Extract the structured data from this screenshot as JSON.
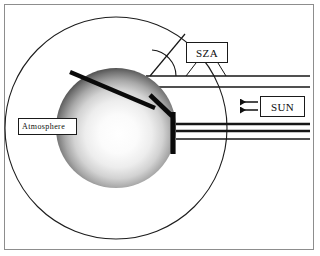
{
  "figure": {
    "background_color": "#ffffff",
    "frame_color": "#8d8d8d",
    "ink_color": "#0d0d0d"
  },
  "labels": {
    "sza": "SZA",
    "sun": "SUN",
    "atmosphere": "Atmosphere"
  },
  "elements": {
    "outer_circle_name": "atmosphere-boundary-circle",
    "planet_name": "planet-sphere",
    "zenith_name": "zenith-direction-bar",
    "surface_name": "surface-tangent-bar",
    "terminator_name": "terminator-bar",
    "angle_arc_name": "sza-angle-arc",
    "ray_group_name": "solar-ray-lines",
    "arrow_group_name": "sun-direction-arrows"
  },
  "geometry": {
    "outer_circle": {
      "cx": 116,
      "cy": 128,
      "r": 111
    },
    "planet": {
      "cx": 116,
      "cy": 128,
      "r": 60
    },
    "rays_y": [
      76,
      87,
      124,
      131,
      139
    ],
    "arrows_y": [
      102,
      110
    ],
    "arrow_x_start": 256,
    "arrow_x_end": 238
  }
}
